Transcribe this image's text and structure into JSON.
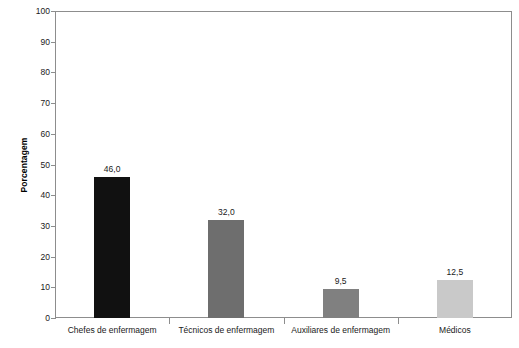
{
  "chart_data": {
    "type": "bar",
    "title": "",
    "xlabel": "",
    "ylabel": "Porcentagem",
    "categories": [
      "Chefes de enfermagem",
      "Técnicos de enfermagem",
      "Auxiliares de enfermagem",
      "Médicos"
    ],
    "values": [
      46.0,
      32.0,
      9.5,
      12.5
    ],
    "value_labels": [
      "46,0",
      "32,0",
      "9,5",
      "12,5"
    ],
    "bar_colors": [
      "#111111",
      "#6e6e6e",
      "#808080",
      "#c9c9c9"
    ],
    "ylim": [
      0,
      100
    ],
    "ytick_step": 10,
    "ytick_labels": [
      "0",
      "10",
      "20",
      "30",
      "40",
      "50",
      "60",
      "70",
      "80",
      "90",
      "100"
    ],
    "grid": false,
    "legend": "none",
    "axis_color": "#8d8d8d"
  }
}
